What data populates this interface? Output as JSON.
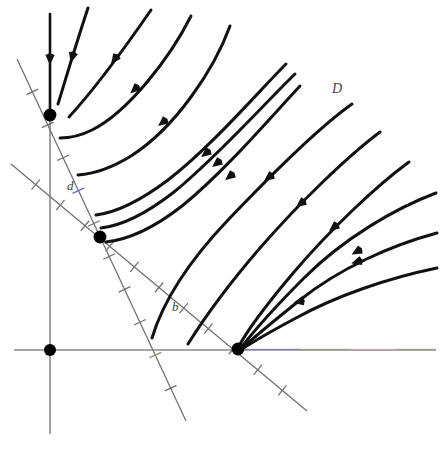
{
  "figure": {
    "kind": "phase-portrait",
    "width": 448,
    "height": 449,
    "background": "#ffffff"
  },
  "colors": {
    "trajectory": "#111111",
    "axis": "#8a8a8a",
    "nullcline": "#6f6f6f",
    "equilibrium": "#000000",
    "label": "#3a3a3a",
    "fringe_blue": "#6a6ad0",
    "fringe_green": "#86a06a",
    "fringe_pink": "#d8a8c8"
  },
  "labels": [
    {
      "id": "label-d",
      "text": "d",
      "x": 67,
      "y": 190,
      "role": "nullcline-label"
    },
    {
      "id": "label-b",
      "text": "b",
      "x": 172,
      "y": 311,
      "role": "nullcline-label"
    },
    {
      "id": "label-D",
      "text": "D",
      "x": 332,
      "y": 93,
      "role": "region-label"
    }
  ],
  "axes": {
    "vertical": {
      "x": 50,
      "y1": 14,
      "y2": 434,
      "has_flow_arrow": true,
      "arrow_y": 60
    },
    "horizontal": {
      "y": 350,
      "x1": 14,
      "x2": 436
    }
  },
  "equilibria": [
    {
      "id": "eq-origin",
      "x": 50,
      "y": 350,
      "r": 6.0,
      "note": "origin"
    },
    {
      "id": "eq-vertical-axis",
      "x": 50,
      "y": 115,
      "r": 6.4,
      "note": "on vertical axis"
    },
    {
      "id": "eq-interior",
      "x": 100,
      "y": 237,
      "r": 6.4,
      "note": "interior crossing of nullclines"
    },
    {
      "id": "eq-horizontal-axis",
      "x": 238,
      "y": 349,
      "r": 6.4,
      "note": "on horizontal axis"
    }
  ],
  "nullclines": [
    {
      "id": "nullcline-d",
      "label": "d",
      "x1": 17,
      "y1": 59,
      "x2": 186,
      "y2": 421,
      "hash_count": 10,
      "hash_len": 13,
      "hash_tints": {
        "4": "blue",
        "9": "green"
      }
    },
    {
      "id": "nullcline-b",
      "label": "b",
      "x1": 11,
      "y1": 164,
      "x2": 307,
      "y2": 411,
      "hash_count": 11,
      "hash_len": 13,
      "hash_tints": {}
    }
  ],
  "trajectories": [
    {
      "id": "traj-axis-flow",
      "d": "M 50 14 L 50 112",
      "arrows": [
        {
          "x": 50,
          "y": 60,
          "angle": 90
        }
      ]
    },
    {
      "id": "traj-1",
      "d": "M 88 8 C 76 44 66 78 58 104",
      "arrows": [
        {
          "x": 72,
          "y": 58,
          "angle": 107
        }
      ]
    },
    {
      "id": "traj-2",
      "d": "M 151 10 C 122 52 92 92 69 117",
      "arrows": [
        {
          "x": 114,
          "y": 60,
          "angle": 127
        }
      ]
    },
    {
      "id": "traj-3",
      "d": "M 191 16 C 170 58 128 112 92 130 C 80 136 68 138 60 138",
      "arrows": [
        {
          "x": 134,
          "y": 90,
          "angle": 137
        }
      ]
    },
    {
      "id": "traj-4",
      "d": "M 230 26 C 214 70 175 128 131 156 C 110 169 92 174 78 175",
      "arrows": [
        {
          "x": 162,
          "y": 123,
          "angle": 141
        }
      ]
    },
    {
      "id": "traj-5",
      "d": "M 286 64 C 258 92 212 146 168 180 C 136 204 112 213 96 215",
      "arrows": [
        {
          "x": 205,
          "y": 154,
          "angle": 142
        }
      ]
    },
    {
      "id": "traj-6",
      "d": "M 295 74 C 264 104 216 158 174 192 C 142 217 118 226 101 228",
      "arrows": [
        {
          "x": 216,
          "y": 164,
          "angle": 142
        }
      ]
    },
    {
      "id": "traj-7",
      "d": "M 300 86 C 270 118 224 172 182 206 C 150 231 124 240 106 242",
      "arrows": [
        {
          "x": 229,
          "y": 177,
          "angle": 142
        }
      ]
    },
    {
      "id": "traj-8",
      "d": "M 352 104 C 318 128 270 176 228 220 C 190 260 164 298 152 338",
      "arrows": [
        {
          "x": 268,
          "y": 178,
          "angle": 143
        }
      ]
    },
    {
      "id": "traj-9",
      "d": "M 380 132 C 348 156 300 202 260 248 C 222 292 198 328 188 344",
      "arrows": [
        {
          "x": 300,
          "y": 204,
          "angle": 143
        }
      ]
    },
    {
      "id": "traj-10",
      "d": "M 409 162 C 376 186 330 230 294 272 C 262 310 244 336 238 348",
      "arrows": [
        {
          "x": 333,
          "y": 228,
          "angle": 142
        }
      ]
    },
    {
      "id": "traj-11",
      "d": "M 436 193 C 396 208 344 238 304 278 C 272 310 250 336 240 349",
      "arrows": [
        {
          "x": 356,
          "y": 252,
          "angle": 150
        }
      ]
    },
    {
      "id": "traj-12",
      "d": "M 437 233 C 392 245 340 268 300 300 C 270 324 250 341 240 350",
      "arrows": [
        {
          "x": 356,
          "y": 262,
          "angle": 163
        }
      ]
    },
    {
      "id": "traj-13",
      "d": "M 437 268 C 388 278 336 296 296 318 C 266 334 248 345 239 351",
      "arrows": [
        {
          "x": 298,
          "y": 302,
          "angle": 167
        }
      ]
    }
  ]
}
